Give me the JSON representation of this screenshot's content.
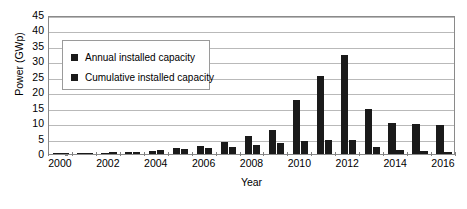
{
  "chart_data": {
    "type": "bar",
    "title": "",
    "xlabel": "Year",
    "ylabel": "Power (GWp)",
    "ylim": [
      0,
      45
    ],
    "ytick_step": 5,
    "yticks": [
      45,
      40,
      35,
      30,
      25,
      20,
      15,
      10,
      5,
      0
    ],
    "grid": true,
    "legend_position": "upper-left-inside",
    "categories": [
      2000,
      2001,
      2002,
      2003,
      2004,
      2005,
      2006,
      2007,
      2008,
      2009,
      2010,
      2011,
      2012,
      2013,
      2014,
      2015,
      2016
    ],
    "xtick_labels": [
      "2000",
      "2002",
      "2004",
      "2006",
      "2008",
      "2010",
      "2012",
      "2014",
      "2016"
    ],
    "series": [
      {
        "name": "Annual installed capacity",
        "color": "#1a1a1a",
        "values": [
          0.2,
          0.3,
          0.4,
          0.6,
          1.1,
          1.9,
          2.5,
          4.0,
          5.9,
          7.9,
          17.5,
          25.1,
          32.0,
          14.5,
          10.2,
          9.8,
          9.5
        ]
      },
      {
        "name": "Cumulative installed capacity",
        "color": "#1a1a1a",
        "values": [
          0.2,
          0.3,
          0.5,
          0.8,
          1.3,
          1.5,
          1.8,
          2.3,
          2.8,
          3.5,
          4.1,
          4.4,
          4.6,
          2.2,
          1.3,
          1.0,
          0.8
        ]
      }
    ],
    "legend": [
      {
        "label": "Annual installed capacity"
      },
      {
        "label": "Cumulative installed capacity"
      }
    ]
  }
}
